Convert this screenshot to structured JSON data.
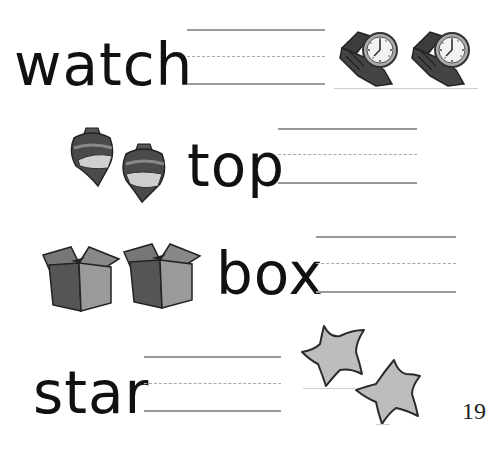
{
  "worksheet": {
    "rows": [
      {
        "word": "watch",
        "picture": "wristwatch-icon",
        "picture_count": 2
      },
      {
        "word": "top",
        "picture": "spinning-top-icon",
        "picture_count": 2
      },
      {
        "word": "box",
        "picture": "open-box-icon",
        "picture_count": 2
      },
      {
        "word": "star",
        "picture": "star-icon",
        "picture_count": 2
      }
    ],
    "page_number": "19"
  },
  "colors": {
    "text": "#111111",
    "guide_line": "#9a9a9a",
    "icon_dark": "#3a3a3a",
    "icon_light": "#b8b8b8"
  }
}
